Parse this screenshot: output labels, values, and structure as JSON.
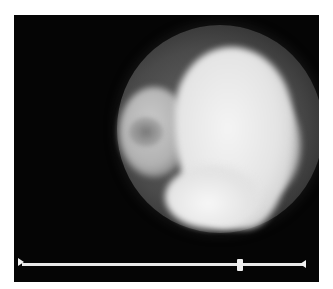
{
  "viewer": {
    "content": "circular endoscopic grayscale frame",
    "background_color": "#050505"
  },
  "timeline": {
    "position_percent": 77,
    "start_marker_icon": "triangle-right-icon",
    "end_marker_icon": "triangle-left-icon",
    "track_color": "#e8e8e8"
  }
}
